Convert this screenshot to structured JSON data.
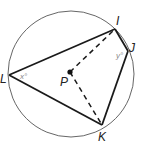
{
  "diagram": {
    "type": "inscribed-quadrilateral-in-circle",
    "circle": {
      "center_label": "P",
      "cx": 71,
      "cy": 74,
      "r": 63
    },
    "points": {
      "I": {
        "label": "I",
        "x": 115,
        "y": 29
      },
      "J": {
        "label": "J",
        "x": 128,
        "y": 51
      },
      "K": {
        "label": "K",
        "x": 102,
        "y": 125
      },
      "L": {
        "label": "L",
        "x": 9,
        "y": 75
      },
      "P": {
        "label": "P",
        "x": 70,
        "y": 72
      }
    },
    "solid_segments": [
      "LI",
      "IJ",
      "JK",
      "KL"
    ],
    "dashed_segments": [
      "PI",
      "PK"
    ],
    "angle_labels": {
      "at_L": "x°",
      "at_J": "y°"
    },
    "colors": {
      "stroke": "#1a1a1a",
      "circle": "#555555",
      "angle_text": "#888888"
    }
  }
}
